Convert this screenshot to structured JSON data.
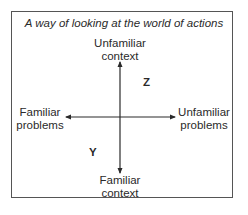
{
  "title": "A way of looking at the world of actions",
  "axes": {
    "top": {
      "line1": "Unfamiliar",
      "line2": "context"
    },
    "bottom": {
      "line1": "Familiar",
      "line2": "context"
    },
    "left": {
      "line1": "Familiar",
      "line2": "problems"
    },
    "right": {
      "line1": "Unfamiliar",
      "line2": "problems"
    }
  },
  "quadrant_labels": {
    "upper_right": "Z",
    "lower_left": "Y"
  },
  "colors": {
    "line": "#2a2a2a",
    "border": "#555555",
    "background": "#ffffff"
  }
}
